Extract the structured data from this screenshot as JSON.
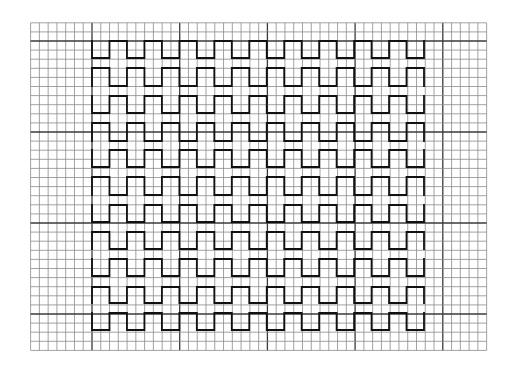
{
  "figure": {
    "background": "#ffffff",
    "colors": {
      "grid_minor": "#8a8a8a",
      "grid_major": "#3a3a3a",
      "wave": "#111111"
    }
  },
  "grid": {
    "x_origin": 92,
    "x_step": 8.77,
    "x_index_start": -7,
    "x_index_end": 45,
    "y_origin": 41,
    "y_step": 9.1,
    "y_index_start": -2,
    "y_index_end": 34,
    "major_every": 10
  },
  "waves": {
    "x_start": 92,
    "x_end": 424,
    "half_periods": 19,
    "rows": [
      {
        "top": 41,
        "bottom": 58,
        "first": "bottom"
      },
      {
        "top": 68,
        "bottom": 86,
        "first": "top"
      },
      {
        "top": 96,
        "bottom": 113,
        "first": "bottom"
      },
      {
        "top": 123,
        "bottom": 141,
        "first": "top"
      },
      {
        "top": 150,
        "bottom": 167,
        "first": "bottom"
      },
      {
        "top": 177,
        "bottom": 195,
        "first": "top"
      },
      {
        "top": 205,
        "bottom": 222,
        "first": "bottom"
      },
      {
        "top": 232,
        "bottom": 249,
        "first": "top"
      },
      {
        "top": 259,
        "bottom": 276,
        "first": "bottom"
      },
      {
        "top": 287,
        "bottom": 303,
        "first": "top"
      },
      {
        "top": 313,
        "bottom": 330,
        "first": "bottom"
      }
    ]
  }
}
